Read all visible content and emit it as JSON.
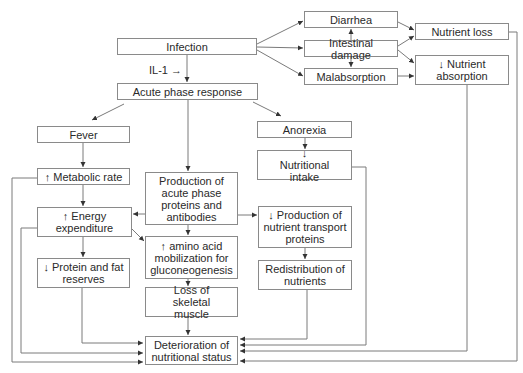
{
  "diagram": {
    "nodes": {
      "infection": "Infection",
      "il1": "IL-1 →",
      "acute_phase": "Acute phase response",
      "diarrhea": "Diarrhea",
      "intestinal_damage": "Intestinal damage",
      "malabsorption": "Malabsorption",
      "nutrient_loss": "Nutrient loss",
      "nutrient_absorption": "↓ Nutrient absorption",
      "fever": "Fever",
      "metabolic_rate": "↑ Metabolic rate",
      "energy_expenditure": "↑ Energy expenditure",
      "protein_fat_reserves": "↓ Protein and fat reserves",
      "production_acute": "Production of acute phase proteins and antibodies",
      "amino_acid": "↑ amino acid mobilization for gluconeogenesis",
      "loss_skeletal": "Loss of skeletal muscle",
      "deterioration": "Deterioration of nutritional status",
      "anorexia": "Anorexia",
      "nutritional_intake": "↓ Nutritional intake",
      "transport_proteins": "↓ Production of nutrient transport proteins",
      "redistribution": "Redistribution of nutrients"
    },
    "edges": [
      [
        "Infection",
        "Diarrhea"
      ],
      [
        "Infection",
        "Intestinal damage"
      ],
      [
        "Infection",
        "Malabsorption"
      ],
      [
        "Intestinal damage",
        "Diarrhea"
      ],
      [
        "Intestinal damage",
        "Malabsorption"
      ],
      [
        "Diarrhea",
        "Nutrient loss"
      ],
      [
        "Intestinal damage",
        "Nutrient loss"
      ],
      [
        "Intestinal damage",
        "↓ Nutrient absorption"
      ],
      [
        "Malabsorption",
        "↓ Nutrient absorption"
      ],
      [
        "Infection",
        "Acute phase response"
      ],
      [
        "Acute phase response",
        "Fever"
      ],
      [
        "Acute phase response",
        "Production of acute phase proteins and antibodies"
      ],
      [
        "Acute phase response",
        "Anorexia"
      ],
      [
        "Fever",
        "↑ Metabolic rate"
      ],
      [
        "↑ Metabolic rate",
        "↑ Energy expenditure"
      ],
      [
        "↑ Energy expenditure",
        "↓ Protein and fat reserves"
      ],
      [
        "↑ Energy expenditure",
        "↑ amino acid mobilization for gluconeogenesis"
      ],
      [
        "Production of acute phase proteins and antibodies",
        "↑ Energy expenditure"
      ],
      [
        "Production of acute phase proteins and antibodies",
        "↑ amino acid mobilization for gluconeogenesis"
      ],
      [
        "Production of acute phase proteins and antibodies",
        "↓ Production of nutrient transport proteins"
      ],
      [
        "↑ amino acid mobilization for gluconeogenesis",
        "Loss of skeletal muscle"
      ],
      [
        "Loss of skeletal muscle",
        "Deterioration of nutritional status"
      ],
      [
        "Anorexia",
        "↓ Nutritional intake"
      ],
      [
        "↓ Production of nutrient transport proteins",
        "Redistribution of nutrients"
      ],
      [
        "↓ Protein and fat reserves",
        "Deterioration of nutritional status"
      ],
      [
        "↑ Energy expenditure",
        "Deterioration of nutritional status"
      ],
      [
        "↑ Metabolic rate",
        "Deterioration of nutritional status"
      ],
      [
        "Redistribution of nutrients",
        "Deterioration of nutritional status"
      ],
      [
        "↓ Nutritional intake",
        "Deterioration of nutritional status"
      ],
      [
        "↓ Nutrient absorption",
        "Deterioration of nutritional status"
      ],
      [
        "Nutrient loss",
        "Deterioration of nutritional status"
      ]
    ],
    "colors": {
      "line": "#7a7a7a",
      "border": "#8a8a8a",
      "text": "#2a2a2a"
    }
  }
}
